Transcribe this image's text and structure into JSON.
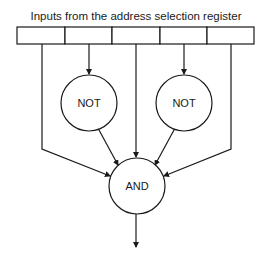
{
  "diagram": {
    "title": "Inputs from the address selection register",
    "register": {
      "cells": 5,
      "label": "address selection register"
    },
    "gates": {
      "not_left": {
        "label": "NOT"
      },
      "not_right": {
        "label": "NOT"
      },
      "and": {
        "label": "AND"
      }
    },
    "connections": [
      {
        "from": "register-bit-1",
        "to": "AND"
      },
      {
        "from": "register-bit-2",
        "to": "NOT-left"
      },
      {
        "from": "NOT-left",
        "to": "AND"
      },
      {
        "from": "register-bit-3",
        "to": "AND"
      },
      {
        "from": "register-bit-4",
        "to": "NOT-right"
      },
      {
        "from": "NOT-right",
        "to": "AND"
      },
      {
        "from": "register-bit-5",
        "to": "AND"
      },
      {
        "from": "AND",
        "to": "output"
      }
    ],
    "colors": {
      "line": "#1a1a1a",
      "background": "#ffffff"
    }
  }
}
